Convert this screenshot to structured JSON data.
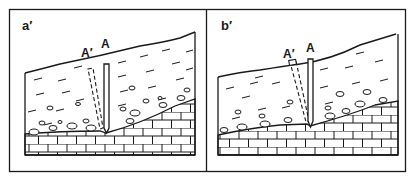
{
  "figure": {
    "panels": [
      {
        "id": "a",
        "label": "a′",
        "stake_original_label": "A",
        "stake_displaced_label": "A′",
        "displaced_stake_state": "tilted, buried in sediment"
      },
      {
        "id": "b",
        "label": "b′",
        "stake_original_label": "A",
        "stake_displaced_label": "A′",
        "displaced_stake_state": "tilted, top exposed at surface"
      }
    ],
    "legend": {
      "sediment": "dashed lines (fine sediment)",
      "pebbles": "ovals (coarse clasts)",
      "bedrock": "brick pattern (limestone)"
    },
    "colors": {
      "ink": "#1a1a1a",
      "background": "#ffffff"
    }
  }
}
